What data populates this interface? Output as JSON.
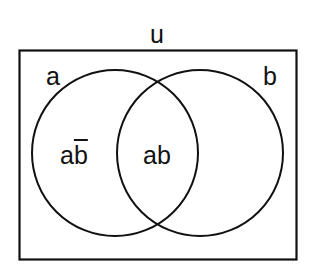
{
  "diagram": {
    "type": "venn",
    "universe_label": "u",
    "sets": [
      {
        "name": "a",
        "label": "a"
      },
      {
        "name": "b",
        "label": "b"
      }
    ],
    "regions": [
      {
        "id": "a-only",
        "label_base": "a",
        "label_overlined": "b",
        "meaning": "a and not b"
      },
      {
        "id": "intersection",
        "label": "ab",
        "meaning": "a and b"
      }
    ],
    "stroke_color": "#111111",
    "background": "#ffffff"
  }
}
